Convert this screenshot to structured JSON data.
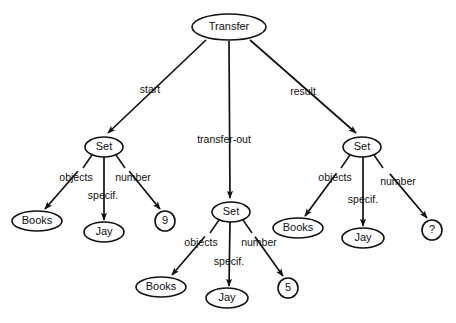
{
  "diagram": {
    "colors": {
      "stroke": "#111111",
      "fill": "#ffffff",
      "background": "#ffffff"
    },
    "nodes": [
      {
        "id": "transfer",
        "label": "Transfer",
        "shape": "ellipse",
        "cx": 229,
        "cy": 27,
        "rx": 37,
        "ry": 13
      },
      {
        "id": "set-start",
        "label": "Set",
        "shape": "ellipse",
        "cx": 104,
        "cy": 147,
        "rx": 19,
        "ry": 10
      },
      {
        "id": "set-out",
        "label": "Set",
        "shape": "ellipse",
        "cx": 231,
        "cy": 212,
        "rx": 19,
        "ry": 10
      },
      {
        "id": "set-result",
        "label": "Set",
        "shape": "ellipse",
        "cx": 362,
        "cy": 147,
        "rx": 19,
        "ry": 10
      },
      {
        "id": "books-start",
        "label": "Books",
        "shape": "ellipse",
        "cx": 37,
        "cy": 221,
        "rx": 25,
        "ry": 10
      },
      {
        "id": "jay-start",
        "label": "Jay",
        "shape": "ellipse",
        "cx": 104,
        "cy": 232,
        "rx": 20,
        "ry": 10
      },
      {
        "id": "num-start",
        "label": "9",
        "shape": "circle",
        "cx": 165,
        "cy": 221,
        "rx": 10,
        "ry": 10
      },
      {
        "id": "books-out",
        "label": "Books",
        "shape": "ellipse",
        "cx": 161,
        "cy": 287,
        "rx": 25,
        "ry": 10
      },
      {
        "id": "jay-out",
        "label": "Jay",
        "shape": "ellipse",
        "cx": 227,
        "cy": 298,
        "rx": 21,
        "ry": 10
      },
      {
        "id": "num-out",
        "label": "5",
        "shape": "circle",
        "cx": 288,
        "cy": 288,
        "rx": 10,
        "ry": 10
      },
      {
        "id": "books-result",
        "label": "Books",
        "shape": "ellipse",
        "cx": 298,
        "cy": 228,
        "rx": 25,
        "ry": 10
      },
      {
        "id": "jay-result",
        "label": "Jay",
        "shape": "ellipse",
        "cx": 363,
        "cy": 238,
        "rx": 21,
        "ry": 10
      },
      {
        "id": "num-result",
        "label": "?",
        "shape": "circle",
        "cx": 432,
        "cy": 230,
        "rx": 10,
        "ry": 10
      }
    ],
    "edges": [
      {
        "id": "e-start",
        "from": "transfer",
        "to": "set-start",
        "label": "start",
        "label_x": 150,
        "label_y": 90,
        "x1": 206,
        "y1": 40,
        "x2": 108,
        "y2": 133,
        "arrow": true
      },
      {
        "id": "e-transfer-out",
        "from": "transfer",
        "to": "set-out",
        "label": "transfer-out",
        "label_x": 224,
        "label_y": 140,
        "x1": 229,
        "y1": 41,
        "x2": 230,
        "y2": 198,
        "arrow": true
      },
      {
        "id": "e-result",
        "from": "transfer",
        "to": "set-result",
        "label": "result",
        "label_x": 303,
        "label_y": 92,
        "x1": 250,
        "y1": 40,
        "x2": 356,
        "y2": 133,
        "arrow": true
      },
      {
        "id": "e-start-objects",
        "from": "set-start",
        "to": "books-start",
        "label": "objects",
        "label_x": 76,
        "label_y": 178,
        "x1": 92,
        "y1": 155,
        "x2": 45,
        "y2": 209,
        "arrow": true,
        "stub_x2": 83,
        "stub_y2": 168
      },
      {
        "id": "e-start-specif",
        "from": "set-start",
        "to": "jay-start",
        "label": "specif.",
        "label_x": 103,
        "label_y": 196,
        "x1": 104,
        "y1": 157,
        "x2": 104,
        "y2": 220,
        "arrow": true
      },
      {
        "id": "e-start-number",
        "from": "set-start",
        "to": "num-start",
        "label": "number",
        "label_x": 133,
        "label_y": 178,
        "x1": 116,
        "y1": 155,
        "x2": 160,
        "y2": 209,
        "arrow": true,
        "stub_x2": 125,
        "stub_y2": 168
      },
      {
        "id": "e-out-objects",
        "from": "set-out",
        "to": "books-out",
        "label": "objects",
        "label_x": 201,
        "label_y": 243,
        "x1": 219,
        "y1": 220,
        "x2": 172,
        "y2": 275,
        "arrow": true,
        "stub_x2": 210,
        "stub_y2": 233
      },
      {
        "id": "e-out-specif",
        "from": "set-out",
        "to": "jay-out",
        "label": "specif.",
        "label_x": 229,
        "label_y": 262,
        "x1": 230,
        "y1": 222,
        "x2": 229,
        "y2": 286,
        "arrow": true
      },
      {
        "id": "e-out-number",
        "from": "set-out",
        "to": "num-out",
        "label": "number",
        "label_x": 259,
        "label_y": 243,
        "x1": 243,
        "y1": 220,
        "x2": 283,
        "y2": 276,
        "arrow": true,
        "stub_x2": 252,
        "stub_y2": 233
      },
      {
        "id": "e-result-objects",
        "from": "set-result",
        "to": "books-result",
        "label": "objects",
        "label_x": 335,
        "label_y": 178,
        "x1": 350,
        "y1": 155,
        "x2": 305,
        "y2": 216,
        "arrow": true,
        "stub_x2": 341,
        "stub_y2": 168
      },
      {
        "id": "e-result-specif",
        "from": "set-result",
        "to": "jay-result",
        "label": "specif.",
        "label_x": 363,
        "label_y": 200,
        "x1": 363,
        "y1": 157,
        "x2": 363,
        "y2": 226,
        "arrow": true
      },
      {
        "id": "e-result-number",
        "from": "set-result",
        "to": "num-result",
        "label": "number",
        "label_x": 398,
        "label_y": 182,
        "x1": 374,
        "y1": 155,
        "x2": 427,
        "y2": 218,
        "arrow": true,
        "stub_x2": 383,
        "stub_y2": 168
      }
    ]
  }
}
